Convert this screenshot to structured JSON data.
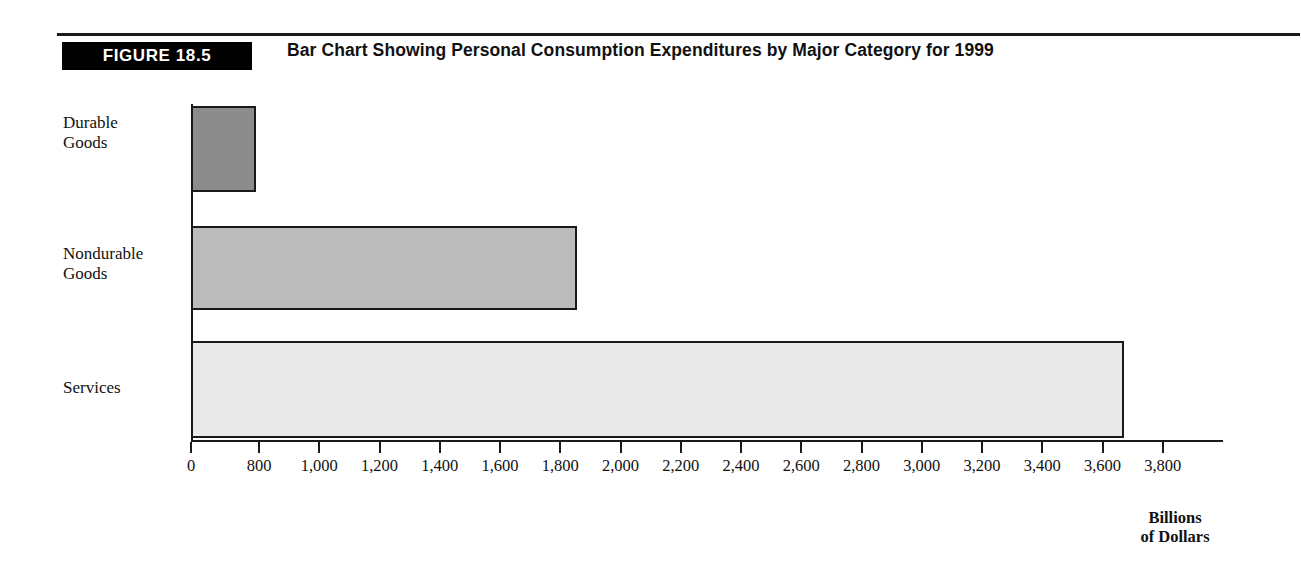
{
  "figure": {
    "badge": "FIGURE 18.5",
    "title": "Bar Chart Showing Personal Consumption Expenditures by Major Category for 1999"
  },
  "chart_data": {
    "type": "bar",
    "orientation": "horizontal",
    "title": "Bar Chart Showing Personal Consumption Expenditures by Major Category for 1999",
    "xlabel": "Billions of Dollars",
    "ylabel": "",
    "categories": [
      "Durable Goods",
      "Nondurable Goods",
      "Services"
    ],
    "values": [
      760,
      1855,
      3670
    ],
    "xlim": [
      0,
      3800
    ],
    "grid": false,
    "legend": null,
    "tick_labels": [
      "0",
      "800",
      "1,000",
      "1,200",
      "1,400",
      "1,600",
      "1,800",
      "2,000",
      "2,200",
      "2,400",
      "2,600",
      "2,800",
      "3,000",
      "3,200",
      "3,400",
      "3,600",
      "3,800"
    ],
    "tick_values": [
      0,
      800,
      1000,
      1200,
      1400,
      1600,
      1800,
      2000,
      2200,
      2400,
      2600,
      2800,
      3000,
      3200,
      3400,
      3600,
      3800
    ],
    "bar_colors": [
      "#8c8c8c",
      "#bcbcbc",
      "#e9e9e9"
    ],
    "bar_edge_color": "#1a1a1a",
    "axis_unit_line1": "Billions",
    "axis_unit_line2": "of Dollars"
  }
}
